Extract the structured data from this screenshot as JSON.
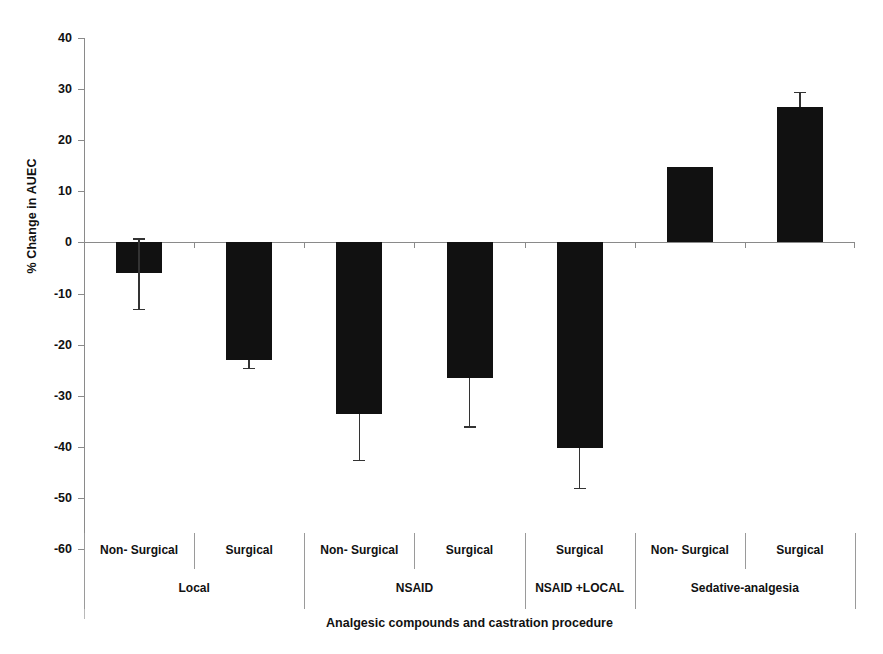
{
  "chart_data": {
    "type": "bar",
    "title": "",
    "xlabel": "Analgesic compounds and castration procedure",
    "ylabel": "% Change in AUEC",
    "ylim": [
      -60,
      40
    ],
    "ytick_labels": [
      "40",
      "30",
      "20",
      "10",
      "0",
      "-10",
      "-20",
      "-30",
      "-40",
      "-50",
      "-60"
    ],
    "yticks": [
      40,
      30,
      20,
      10,
      0,
      -10,
      -20,
      -30,
      -40,
      -50,
      -60
    ],
    "grid": false,
    "legend": "none",
    "categories": [
      "Non- Surgical",
      "Surgical",
      "Non- Surgical",
      "Surgical",
      "Surgical",
      "Non- Surgical",
      "Surgical"
    ],
    "groups": [
      {
        "label": "Local",
        "span": 2
      },
      {
        "label": "NSAID",
        "span": 2
      },
      {
        "label": "NSAID +LOCAL",
        "span": 1
      },
      {
        "label": "Sedative-analgesia",
        "span": 2
      }
    ],
    "values": [
      -6.0,
      -23.0,
      -33.5,
      -26.5,
      -40.3,
      14.8,
      26.5
    ],
    "errors_low": [
      -13.0,
      -24.5,
      -42.5,
      -36.0,
      -48.0,
      null,
      null
    ],
    "errors_high": [
      0.8,
      null,
      null,
      null,
      null,
      null,
      29.5
    ],
    "bar_color": "#111111",
    "axis_color": "#8a8a8a",
    "error_color": "#333333"
  },
  "axis": {
    "y_label": "% Change in AUEC",
    "x_title": "Analgesic compounds and castration procedure"
  }
}
